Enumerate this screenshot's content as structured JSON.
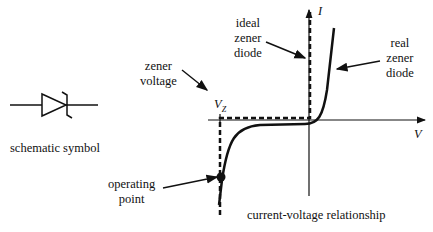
{
  "symbol": {
    "caption": "schematic symbol"
  },
  "graph": {
    "caption": "current-voltage relationship",
    "x_axis_label": "V",
    "y_axis_label": "I",
    "vz_label": "V",
    "vz_subscript": "Z"
  },
  "annotations": {
    "zener_voltage": [
      "zener",
      "voltage"
    ],
    "ideal": [
      "ideal",
      "zener",
      "diode"
    ],
    "real": [
      "real",
      "zener",
      "diode"
    ],
    "operating_point": [
      "operating",
      "point"
    ]
  },
  "colors": {
    "ink": "#111111",
    "background": "#ffffff"
  }
}
